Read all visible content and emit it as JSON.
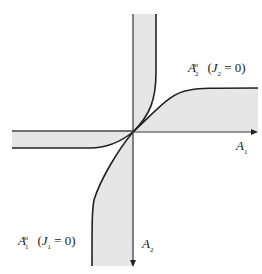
{
  "diagram": {
    "type": "phase-diagram",
    "axes": {
      "horizontal": {
        "label": "A",
        "sub": "1"
      },
      "vertical": {
        "label": "A",
        "sub": "2"
      }
    },
    "curves": [
      {
        "label": "A",
        "sub": "2",
        "sup": "st",
        "condition_var": "J",
        "condition_sub": "2",
        "condition_rest": " = 0)"
      },
      {
        "label": "A",
        "sub": "1",
        "sup": "st",
        "condition_var": "J",
        "condition_sub": "1",
        "condition_rest": " = 0)"
      }
    ],
    "colors": {
      "band_fill": "#e6e6e6",
      "line": "#222222"
    }
  }
}
